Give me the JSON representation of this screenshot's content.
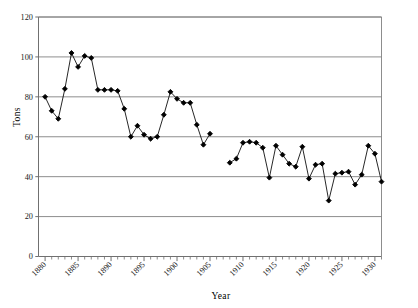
{
  "chart_data": {
    "type": "line",
    "title": "",
    "xlabel": "Year",
    "ylabel": "Tons",
    "xlim": [
      1879,
      1931
    ],
    "ylim": [
      0,
      120
    ],
    "ytick_values": [
      0,
      20,
      40,
      60,
      80,
      100,
      120
    ],
    "ytick_labels": [
      "0",
      "20",
      "40",
      "60",
      "80",
      "100",
      "120"
    ],
    "xtick_major_values": [
      1880,
      1885,
      1890,
      1895,
      1900,
      1905,
      1910,
      1915,
      1920,
      1925,
      1930
    ],
    "xtick_major_labels": [
      "1880",
      "1885",
      "1890",
      "1895",
      "1900",
      "1905",
      "1910",
      "1915",
      "1920",
      "1925",
      "1930"
    ],
    "xtick_minor_step": 1,
    "grid": "horizontal",
    "legend": "none",
    "marker": "filled-diamond",
    "line_color": "#000000",
    "marker_color": "#000000",
    "grid_color": "#808080",
    "series": [
      {
        "name": "Tons",
        "x": [
          1880,
          1881,
          1882,
          1883,
          1884,
          1885,
          1886,
          1887,
          1888,
          1889,
          1890,
          1891,
          1892,
          1893,
          1894,
          1895,
          1896,
          1897,
          1898,
          1899,
          1900,
          1901,
          1902,
          1903,
          1904,
          1905,
          1908,
          1909,
          1910,
          1911,
          1912,
          1913,
          1914,
          1915,
          1916,
          1917,
          1918,
          1919,
          1920,
          1921,
          1922,
          1923,
          1924,
          1925,
          1926,
          1927,
          1928,
          1929,
          1930,
          1931
        ],
        "y": [
          80,
          73,
          69,
          84,
          102,
          95,
          100.5,
          99.5,
          83.5,
          83.5,
          83.5,
          83,
          74,
          60,
          65.5,
          61,
          59,
          60,
          71,
          82.5,
          79,
          77,
          77,
          66,
          56,
          61.5,
          47,
          49,
          57,
          57.5,
          57,
          54.5,
          39.5,
          55.5,
          51,
          46.5,
          45,
          55,
          39,
          46,
          46.5,
          28,
          41.5,
          42,
          42.5,
          36,
          41,
          55.5,
          51.5,
          37.5
        ],
        "gaps_after_x": [
          1905
        ]
      }
    ]
  },
  "axes": {
    "y_axis_title": "Tons",
    "x_axis_title": "Year"
  }
}
